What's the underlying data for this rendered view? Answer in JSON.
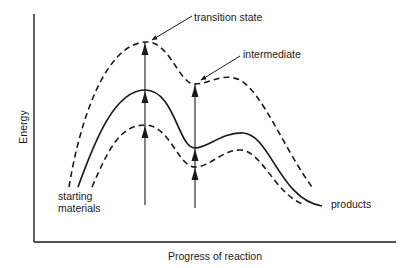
{
  "diagram": {
    "type": "reaction energy profile",
    "axes": {
      "y_label": "Energy",
      "x_label": "Progress of reaction"
    },
    "annotations": {
      "transition_state": "transition state",
      "intermediate": "intermediate",
      "starting_line1": "starting",
      "starting_line2": "materials",
      "products": "products"
    },
    "curves": [
      {
        "name": "upper-dashed",
        "style": "dashed",
        "points": "start (69,187), peak (145,42), trough (195,84), hump (235,78), end (312,187)"
      },
      {
        "name": "middle-solid",
        "style": "solid",
        "points": "start (78,187), peak (145,90), trough (195,148), hump (243,133), end (322,205)"
      },
      {
        "name": "lower-dashed",
        "style": "dashed",
        "points": "start (92,187), peak (145,125), trough (195,167), hump (240,150), end (305,205)"
      }
    ],
    "arrows": [
      {
        "name": "transition-state-arrow",
        "x": 145,
        "heads_at_y": [
          42,
          90,
          125
        ]
      },
      {
        "name": "intermediate-arrow",
        "x": 195,
        "heads_at_y": [
          84,
          148,
          167
        ]
      }
    ],
    "colors": {
      "ink": "#1a1a1a",
      "background": "#ffffff"
    }
  }
}
